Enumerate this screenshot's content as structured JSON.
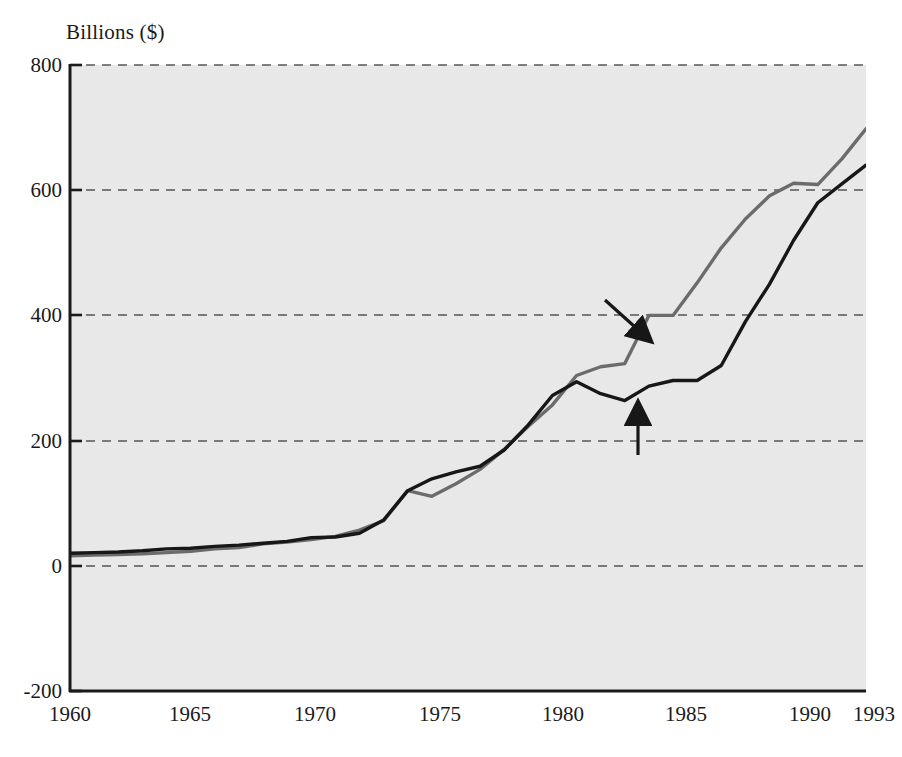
{
  "chart_data": {
    "type": "line",
    "title": "",
    "ylabel": "Billions ($)",
    "xlabel": "",
    "ylim": [
      -200,
      800
    ],
    "xlim": [
      1960,
      1993
    ],
    "yticks": [
      "800",
      "600",
      "400",
      "200",
      "0",
      "-200"
    ],
    "ytick_values": [
      800,
      600,
      400,
      200,
      0,
      -200
    ],
    "xticks": [
      "1960",
      "1965",
      "1970",
      "1975",
      "1980",
      "1985",
      "1990",
      "1993"
    ],
    "xtick_values": [
      1960,
      1965,
      1970,
      1975,
      1980,
      1985,
      1990,
      1993
    ],
    "grid": true,
    "grid_style": "dashed-horizontal",
    "legend_position": "inline-annotations",
    "x": [
      1960,
      1961,
      1962,
      1963,
      1964,
      1965,
      1966,
      1967,
      1968,
      1969,
      1970,
      1971,
      1972,
      1973,
      1974,
      1975,
      1976,
      1977,
      1978,
      1979,
      1980,
      1981,
      1982,
      1983,
      1984,
      1985,
      1986,
      1987,
      1988,
      1989,
      1990,
      1991,
      1992,
      1993
    ],
    "series": [
      {
        "name": "Imports",
        "color": "#6b6b6b",
        "values": [
          16,
          17,
          18,
          19,
          21,
          23,
          27,
          29,
          35,
          38,
          42,
          47,
          57,
          72,
          120,
          111,
          131,
          154,
          186,
          223,
          257,
          304,
          318,
          323,
          400,
          400,
          452,
          508,
          554,
          591,
          611,
          609,
          650,
          698
        ]
      },
      {
        "name": "Exports",
        "color": "#171717",
        "values": [
          20,
          21,
          22,
          24,
          27,
          28,
          31,
          33,
          36,
          39,
          45,
          46,
          52,
          73,
          120,
          139,
          150,
          159,
          185,
          225,
          272,
          294,
          275,
          264,
          287,
          296,
          296,
          320,
          390,
          450,
          520,
          580,
          610,
          640
        ]
      }
    ]
  },
  "annotations": [
    {
      "id": "imports",
      "label": "Imports"
    },
    {
      "id": "exports",
      "label": "Exports"
    }
  ],
  "colors": {
    "plot_background": "#e8e8e8",
    "axis": "#1a1a1a",
    "grid": "#555555",
    "imports_line": "#6b6b6b",
    "exports_line": "#171717"
  }
}
